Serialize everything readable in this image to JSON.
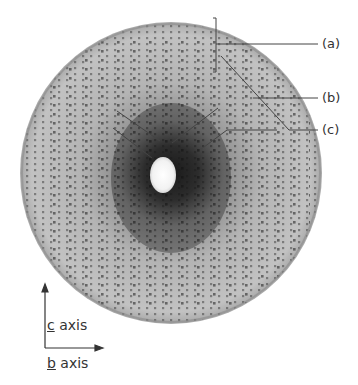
{
  "figure": {
    "type": "X-ray diffraction precession photograph",
    "labels": [
      {
        "id": "a",
        "text": "(a)"
      },
      {
        "id": "b",
        "text": "(b)"
      },
      {
        "id": "c",
        "text": "(c)"
      }
    ],
    "axes": {
      "vertical": {
        "letter": "c",
        "suffix": " axis"
      },
      "horizontal": {
        "letter": "b",
        "suffix": " axis"
      }
    },
    "colors": {
      "background": "#ffffff",
      "film": "#b8b8b8",
      "spot": "#1a1a1a",
      "leader_line": "#444444",
      "text": "#333333"
    }
  }
}
